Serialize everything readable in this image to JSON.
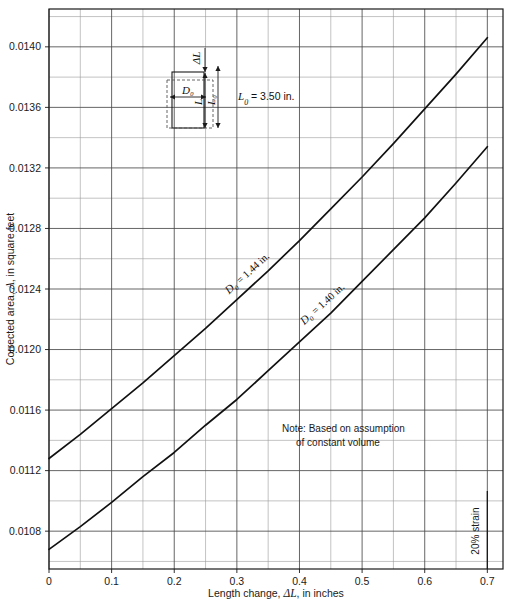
{
  "chart_data": {
    "type": "line",
    "title": "",
    "xlabel": "Length change, ΔL, in inches",
    "ylabel": "Corrected area, A, in square feet",
    "xlim": [
      0,
      0.725
    ],
    "ylim": [
      0.01055,
      0.01425
    ],
    "grid": true,
    "grid_major_x_step": 0.1,
    "grid_minor_x_step": 0.05,
    "grid_major_y_step": 0.0004,
    "grid_minor_y_step": 0.0002,
    "xticks": [
      "0",
      "0.1",
      "0.2",
      "0.3",
      "0.4",
      "0.5",
      "0.6",
      "0.7"
    ],
    "xtick_values": [
      0,
      0.1,
      0.2,
      0.3,
      0.4,
      0.5,
      0.6,
      0.7
    ],
    "yticks": [
      "0.0108",
      "0.0112",
      "0.0116",
      "0.0120",
      "0.0124",
      "0.0128",
      "0.0132",
      "0.0136",
      "0.0140"
    ],
    "ytick_values": [
      0.0108,
      0.0112,
      0.0116,
      0.012,
      0.0124,
      0.0128,
      0.0132,
      0.0136,
      0.014
    ],
    "legend_position": "inline-on-curves",
    "series": [
      {
        "name": "D0 = 1.44 in.",
        "label": "D₀ = 1.44 in.",
        "label_at_x": 0.33,
        "color": "#111111",
        "x": [
          0,
          0.05,
          0.1,
          0.15,
          0.2,
          0.25,
          0.3,
          0.35,
          0.4,
          0.45,
          0.5,
          0.55,
          0.6,
          0.65,
          0.7
        ],
        "y": [
          0.01128,
          0.01144,
          0.01161,
          0.01178,
          0.01196,
          0.01214,
          0.01233,
          0.01252,
          0.01272,
          0.01293,
          0.01314,
          0.01336,
          0.01359,
          0.01382,
          0.01406
        ]
      },
      {
        "name": "D0 = 1.40 in.",
        "label": "D₀ = 1.40 in.",
        "label_at_x": 0.45,
        "color": "#111111",
        "x": [
          0,
          0.05,
          0.1,
          0.15,
          0.2,
          0.25,
          0.3,
          0.35,
          0.4,
          0.45,
          0.5,
          0.55,
          0.6,
          0.65,
          0.7
        ],
        "y": [
          0.01068,
          0.01083,
          0.01099,
          0.01116,
          0.01132,
          0.0115,
          0.01167,
          0.01186,
          0.01205,
          0.01224,
          0.01245,
          0.01266,
          0.01287,
          0.0131,
          0.01334
        ]
      }
    ],
    "annotations": {
      "note_line1": "Note: Based on assumption",
      "note_line2": "of constant volume",
      "strain_marker_label": "20% strain",
      "strain_marker_x": 0.7
    }
  },
  "diagram": {
    "name": "specimen-sketch",
    "label_d0": "D₀",
    "label_l": "L",
    "label_l0": "L₀",
    "label_delta_l": "ΔL",
    "label_l0_value": "L₀ = 3.50 in."
  },
  "colors": {
    "curve": "#111111",
    "grid_major": "#4a4a4a",
    "grid_minor": "#9a9a9a",
    "axis": "#1a1a1a",
    "background": "#ffffff"
  }
}
